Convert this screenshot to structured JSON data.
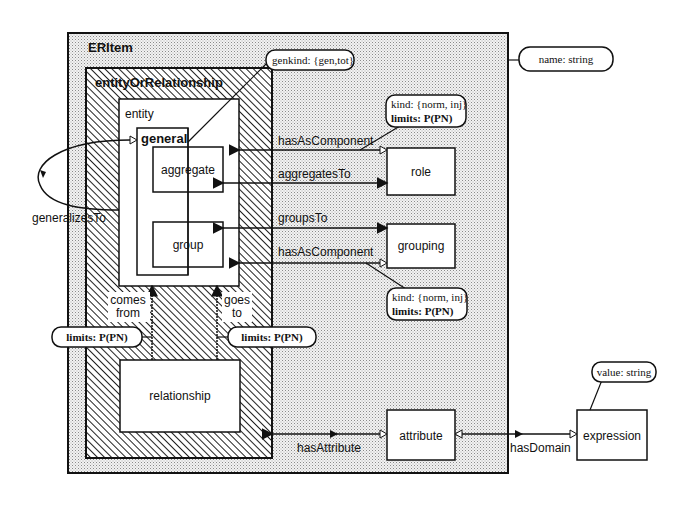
{
  "diagram": {
    "containers": {
      "eritem": {
        "label": "ERItem"
      },
      "entity_or_relationship": {
        "label": "entityOrRelationship"
      },
      "entity": {
        "label": "entity"
      },
      "general": {
        "label": "general"
      }
    },
    "classes": {
      "aggregate": "aggregate",
      "group": "group",
      "role": "role",
      "grouping": "grouping",
      "relationship": "relationship",
      "attribute": "attribute",
      "expression": "expression"
    },
    "relations": {
      "has_as_component_1": "hasAsComponent",
      "aggregates_to": "aggregatesTo",
      "groups_to": "groupsTo",
      "has_as_component_2": "hasAsComponent",
      "generalizes_to": "generalizesTo",
      "comes_from_1": "comes",
      "comes_from_2": "from",
      "goes_to_1": "goes",
      "goes_to_2": "to",
      "has_attribute": "hasAttribute",
      "has_domain": "hasDomain"
    },
    "annotations": {
      "genkind": "genkind: {gen,tot}",
      "name": "name: string",
      "role_kind": "kind: {norm, inj}",
      "role_limits": "limits: P(PN)",
      "grouping_kind": "kind: {norm, inj}",
      "grouping_limits": "limits: P(PN)",
      "comes_limits": "limits: P(PN)",
      "goes_limits": "limits: P(PN)",
      "value": "value: string"
    },
    "colors": {
      "line": "#111111",
      "dotted_fill": "#d9d9d9",
      "hatch": "#222222",
      "box_fill": "#ffffff"
    }
  }
}
